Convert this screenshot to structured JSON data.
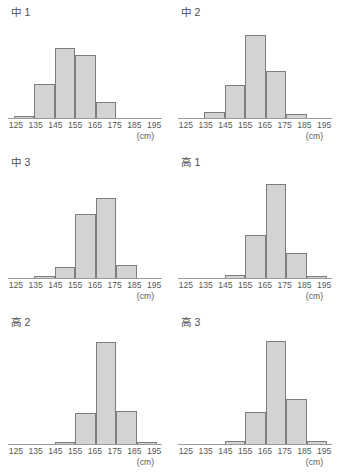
{
  "figure": {
    "unit_label": "(cm)",
    "bar_fill": "#d3d3d3",
    "bar_stroke": "#7d7d7d",
    "axis_color": "#9a9a9a",
    "text_color": "#595959"
  },
  "axis": {
    "tick_labels": [
      "125",
      "135",
      "145",
      "155",
      "165",
      "175",
      "185",
      "195"
    ],
    "bin_edges": [
      125,
      135,
      145,
      155,
      165,
      175,
      185,
      195
    ],
    "bin_labels": [
      "125-135",
      "135-145",
      "145-155",
      "155-165",
      "165-175",
      "175-185",
      "185-195"
    ]
  },
  "panels": [
    {
      "title": "中 1"
    },
    {
      "title": "中 2"
    },
    {
      "title": "中 3"
    },
    {
      "title": "高 1"
    },
    {
      "title": "高 2"
    },
    {
      "title": "高 3"
    }
  ],
  "chart_data": [
    {
      "type": "bar",
      "title": "中 1",
      "xlabel": "(cm)",
      "ylabel": "",
      "grid": false,
      "legend": "none",
      "categories": [
        "125-135",
        "135-145",
        "145-155",
        "155-165",
        "165-175",
        "175-185",
        "185-195"
      ],
      "values": [
        2,
        38,
        78,
        70,
        18,
        0,
        0
      ],
      "ylim": [
        0,
        100
      ]
    },
    {
      "type": "bar",
      "title": "中 2",
      "xlabel": "(cm)",
      "ylabel": "",
      "grid": false,
      "legend": "none",
      "categories": [
        "125-135",
        "135-145",
        "145-155",
        "155-165",
        "165-175",
        "175-185",
        "185-195"
      ],
      "values": [
        0,
        7,
        37,
        92,
        52,
        5,
        0
      ],
      "ylim": [
        0,
        100
      ]
    },
    {
      "type": "bar",
      "title": "中 3",
      "xlabel": "(cm)",
      "ylabel": "",
      "grid": false,
      "legend": "none",
      "categories": [
        "125-135",
        "135-145",
        "145-155",
        "155-165",
        "165-175",
        "175-185",
        "185-195"
      ],
      "values": [
        0,
        2,
        11,
        64,
        80,
        13,
        0
      ],
      "ylim": [
        0,
        100
      ]
    },
    {
      "type": "bar",
      "title": "高 1",
      "xlabel": "(cm)",
      "ylabel": "",
      "grid": false,
      "legend": "none",
      "categories": [
        "125-135",
        "135-145",
        "145-155",
        "155-165",
        "165-175",
        "175-185",
        "185-195"
      ],
      "values": [
        0,
        0,
        3,
        43,
        94,
        25,
        2
      ],
      "ylim": [
        0,
        100
      ]
    },
    {
      "type": "bar",
      "title": "高 2",
      "xlabel": "(cm)",
      "ylabel": "",
      "grid": false,
      "legend": "none",
      "categories": [
        "125-135",
        "135-145",
        "145-155",
        "155-165",
        "165-175",
        "175-185",
        "185-195"
      ],
      "values": [
        0,
        0,
        2,
        29,
        96,
        31,
        2
      ],
      "ylim": [
        0,
        100
      ]
    },
    {
      "type": "bar",
      "title": "高 3",
      "xlabel": "(cm)",
      "ylabel": "",
      "grid": false,
      "legend": "none",
      "categories": [
        "125-135",
        "135-145",
        "145-155",
        "155-165",
        "165-175",
        "175-185",
        "185-195"
      ],
      "values": [
        0,
        0,
        3,
        30,
        97,
        42,
        3
      ],
      "ylim": [
        0,
        100
      ]
    }
  ]
}
